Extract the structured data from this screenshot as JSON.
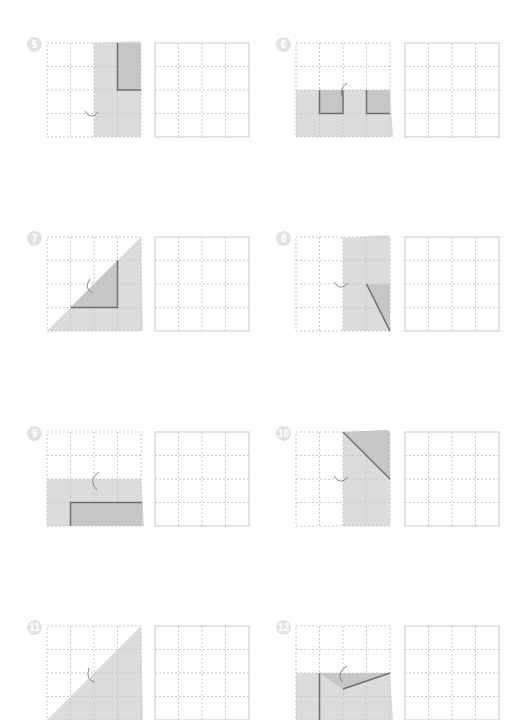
{
  "worksheet": {
    "colors": {
      "grid_line": "#c9c9c9",
      "paper_light": "#dcdcdc",
      "paper_dark": "#c4c4c4",
      "fold_line": "#707070",
      "badge": "#e3e3e3"
    },
    "problems": [
      {
        "number": "5",
        "fold_icon": "fold-arrow-icon"
      },
      {
        "number": "6",
        "fold_icon": "fold-arrow-icon"
      },
      {
        "number": "7",
        "fold_icon": "fold-arrow-icon"
      },
      {
        "number": "8",
        "fold_icon": "fold-arrow-icon"
      },
      {
        "number": "9",
        "fold_icon": "fold-arrow-icon"
      },
      {
        "number": "10",
        "fold_icon": "fold-arrow-icon"
      },
      {
        "number": "11",
        "fold_icon": "fold-arrow-icon"
      },
      {
        "number": "12",
        "fold_icon": "fold-arrow-icon"
      }
    ]
  }
}
